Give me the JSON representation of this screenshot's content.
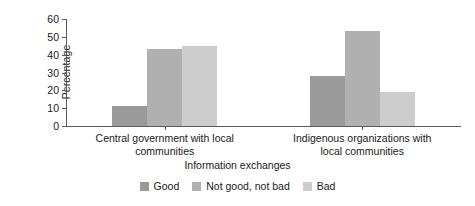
{
  "chart_data": {
    "type": "bar",
    "title": "",
    "xlabel": "Information exchanges",
    "ylabel": "Percentage",
    "categories": [
      "Central government with local\ncommunities",
      "Indigenous organizations with\nlocal communities"
    ],
    "series": [
      {
        "name": "Good",
        "values": [
          11,
          28
        ],
        "color": "#9a9a9a"
      },
      {
        "name": "Not good, not bad",
        "values": [
          43,
          53
        ],
        "color": "#b0b0b0"
      },
      {
        "name": "Bad",
        "values": [
          45,
          19
        ],
        "color": "#cdcdcd"
      }
    ],
    "ylim": [
      0,
      60
    ],
    "yticks": [
      0,
      10,
      20,
      30,
      40,
      50,
      60
    ],
    "ytick_labels": [
      "0",
      "10",
      "20",
      "30",
      "40",
      "50",
      "60"
    ],
    "grid": false,
    "legend_position": "bottom",
    "bar_gap_within_group": 0
  },
  "axis": {
    "y_title": "Percentage",
    "x_title": "Information exchanges"
  }
}
